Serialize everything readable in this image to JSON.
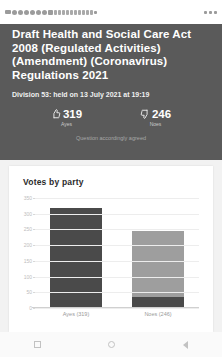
{
  "statusbar": {
    "left_icons": [
      "signal-icon",
      "app-notification-icon",
      "app-notification-icon",
      "app-notification-icon",
      "app-notification-icon",
      "app-notification-icon",
      "app-notification-icon",
      "app-notification-icon",
      "message-icon",
      "message-icon",
      "message-icon",
      "message-icon",
      "message-icon",
      "message-icon",
      "message-icon",
      "message-icon",
      "message-icon",
      "message-icon",
      "play-icon"
    ],
    "right_icons": [
      "wifi-icon",
      "signal-bars-icon",
      "battery-icon"
    ]
  },
  "header": {
    "title": "Draft Health and Social Care Act 2008 (Regulated Activities) (Amendment) (Coronavirus) Regulations 2021",
    "division": "Division 53: held on 13 July 2021 at 19:19",
    "caption": "Question accordingly agreed",
    "ayes": {
      "icon": "thumbs-up-icon",
      "count": "319",
      "label": "Ayes"
    },
    "noes": {
      "icon": "thumbs-down-icon",
      "count": "246",
      "label": "Noes"
    }
  },
  "card": {
    "title": "Votes by party"
  },
  "chart_data": {
    "type": "bar",
    "title": "Votes by party",
    "categories": [
      "Ayes (319)",
      "Noes (246)"
    ],
    "series": [
      {
        "name": "Government",
        "values": [
          319,
          35
        ],
        "color": "#4a4a4a"
      },
      {
        "name": "Opposition",
        "values": [
          0,
          211
        ],
        "color": "#9e9e9e"
      }
    ],
    "values": [
      319,
      246
    ],
    "xlabel": "",
    "ylabel": "",
    "ylim": [
      0,
      350
    ],
    "yticks": [
      350,
      300,
      250,
      200,
      150,
      100,
      50,
      0
    ],
    "ytick_labels": [
      "350",
      "300",
      "250",
      "200",
      "150",
      "100",
      "50",
      "0"
    ],
    "grid": true,
    "legend": "none"
  },
  "navbar": {
    "recents": "recents-icon",
    "home": "home-icon",
    "back": "back-icon"
  }
}
